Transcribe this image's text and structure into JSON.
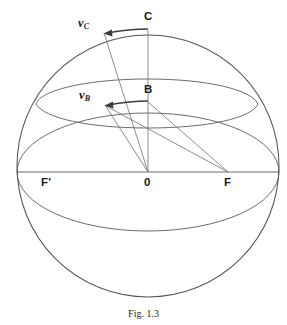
{
  "figure": {
    "caption": "Fig. 1.3",
    "colors": {
      "sphere_outline": "#555555",
      "construction_line": "#5b5b5b",
      "arrow": "#3c3c3c",
      "label_text": "#1a1a1a",
      "background": "#ffffff"
    },
    "points": [
      {
        "id": "C",
        "label": "C",
        "x": 148,
        "y": 30,
        "label_x": 144,
        "label_y": 12
      },
      {
        "id": "B",
        "label": "B",
        "x": 148,
        "y": 102,
        "label_x": 144,
        "label_y": 84
      },
      {
        "id": "O",
        "label": "0",
        "x": 148,
        "y": 172,
        "label_x": 144,
        "label_y": 177
      },
      {
        "id": "F",
        "label": "F",
        "x": 228,
        "y": 172,
        "label_x": 224,
        "label_y": 177
      },
      {
        "id": "Fp",
        "label": "F'",
        "x": 48,
        "y": 172,
        "label_x": 41,
        "label_y": 177
      }
    ],
    "vectors": [
      {
        "id": "vC",
        "symbol": "v",
        "subscript": "C",
        "label": "vC",
        "tail_x": 148,
        "tail_y": 30,
        "tip_x": 104,
        "tip_y": 33,
        "label_x": 78,
        "label_y": 18
      },
      {
        "id": "vB",
        "symbol": "v",
        "subscript": "B",
        "label": "vB",
        "tail_x": 148,
        "tail_y": 102,
        "tip_x": 105,
        "tip_y": 105,
        "label_x": 79,
        "label_y": 90
      }
    ],
    "sphere": {
      "center_x": 148,
      "center_y": 166,
      "radius": 131
    },
    "equator_ellipse": {
      "center_x": 148,
      "center_y": 172,
      "rx": 131,
      "ry": 59
    },
    "latitude_ellipse": {
      "center_x": 148,
      "center_y": 102,
      "rx": 112,
      "ry": 30
    },
    "axis": {
      "y": 172,
      "x_start": 17,
      "x_end": 279
    }
  }
}
